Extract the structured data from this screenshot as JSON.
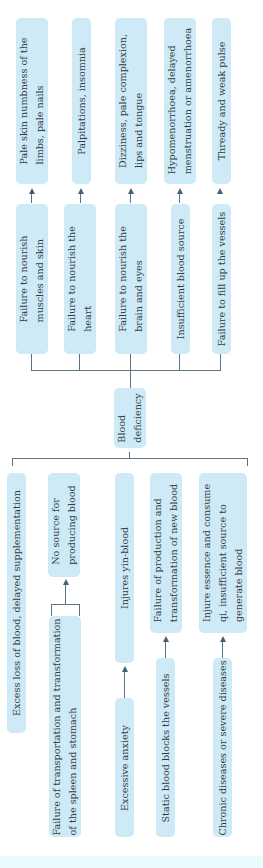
{
  "center": {
    "label_line1": "Blood",
    "label_line2": "deficiency"
  },
  "manifestations": [
    {
      "cause": [
        "Failure to nourish",
        "muscles and skin"
      ],
      "symptom": [
        "Pale skin numbness of the",
        "limbs, pale nails"
      ]
    },
    {
      "cause": [
        "Failure to nourish the",
        "heart"
      ],
      "symptom": [
        "Palpitations, insomnia"
      ]
    },
    {
      "cause": [
        "Failure to nourish the",
        "brain and eyes"
      ],
      "symptom": [
        "Dizziness, pale complexion,",
        "lips and tongue"
      ]
    },
    {
      "cause": [
        "Insufficient blood source"
      ],
      "symptom": [
        "Hypomenorrhoea, delayed",
        "menstruation or amenorrhoea"
      ]
    },
    {
      "cause": [
        "Failure to fill up the vessels"
      ],
      "symptom": [
        "Thready and weak pulse"
      ]
    }
  ],
  "etiology": [
    {
      "mechanism": [
        "Excess loss of blood, delayed supplementation"
      ]
    },
    {
      "origin": [
        "Failure of transportation and transformation",
        "of the spleen and stomach"
      ],
      "mechanism": [
        "No source for",
        "producing blood"
      ]
    },
    {
      "origin": [
        "Excessive anxiety"
      ],
      "mechanism": [
        "Injures yin-blood"
      ]
    },
    {
      "origin": [
        "Static blood blocks the vessels"
      ],
      "mechanism": [
        "Failure of production and",
        "transformation of new blood"
      ]
    },
    {
      "origin": [
        "Chronic diseases or severe diseases"
      ],
      "mechanism": [
        "Injure essence and consume",
        "qi, insufficient source to",
        "generate blood"
      ]
    }
  ],
  "colors": {
    "box": "#cdeaf6",
    "line": "#5a7686",
    "text": "#333b40"
  }
}
